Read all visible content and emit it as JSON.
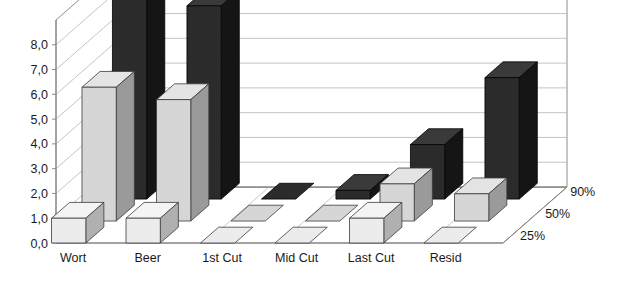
{
  "chart_data": {
    "type": "bar",
    "render": "3d-grouped-bar",
    "title": "",
    "subtitle": "",
    "xlabel": "",
    "ylabel": "",
    "categories": [
      "Wort",
      "Beer",
      "1st Cut",
      "Mid Cut",
      "Last Cut",
      "Resid"
    ],
    "ytick_labels": [
      "0,0",
      "1,0",
      "2,0",
      "3,0",
      "4,0",
      "5,0",
      "6,0",
      "7,0",
      "8,0"
    ],
    "ytick_values": [
      0,
      1,
      2,
      3,
      4,
      5,
      6,
      7,
      8
    ],
    "ylim": [
      0,
      9
    ],
    "grid": true,
    "legend_position": "right-depth-axis",
    "series": [
      {
        "name": "25%",
        "depth_index": 0,
        "color": "#ececec",
        "values": [
          1.0,
          1.0,
          0.0,
          0.0,
          1.0,
          0.0
        ]
      },
      {
        "name": "50%",
        "depth_index": 1,
        "color": "#d6d6d6",
        "values": [
          5.4,
          4.9,
          0.0,
          0.0,
          1.5,
          1.1
        ]
      },
      {
        "name": "90%",
        "depth_index": 2,
        "color": "#2b2b2b",
        "values": [
          8.4,
          7.8,
          0.0,
          0.35,
          2.2,
          4.9
        ]
      }
    ]
  },
  "colors": {
    "background": "#ffffff",
    "grid_line": "#b9b9b9",
    "axis_line": "#808080",
    "text": "#1a1a1a",
    "bar_25_top": "#f4f4f4",
    "bar_25_front": "#ececec",
    "bar_25_side": "#b0b0b0",
    "bar_50_top": "#e4e4e4",
    "bar_50_front": "#d6d6d6",
    "bar_50_side": "#9a9a9a",
    "bar_90_top": "#3a3a3a",
    "bar_90_front": "#2b2b2b",
    "bar_90_side": "#151515"
  }
}
